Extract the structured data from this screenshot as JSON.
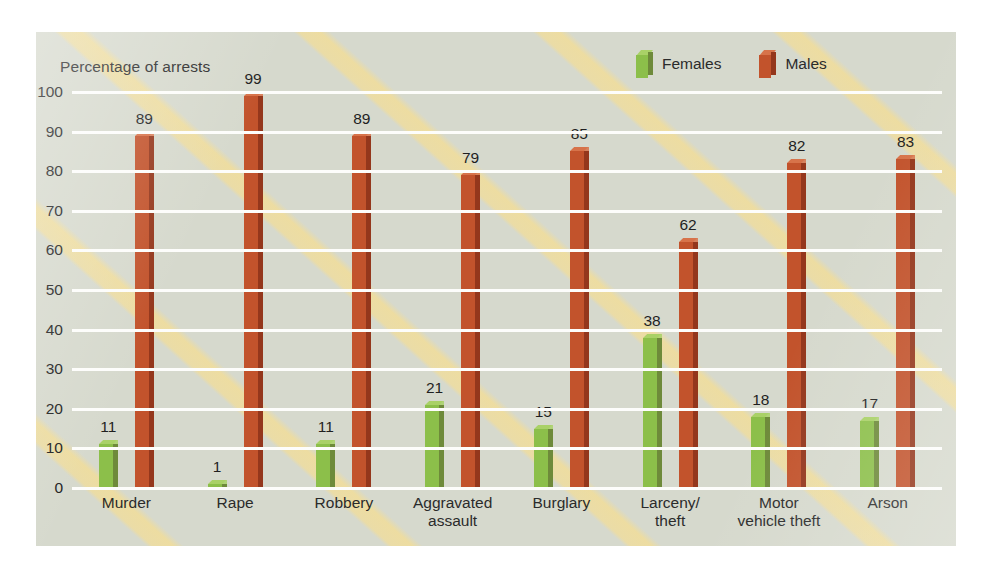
{
  "chart_data": {
    "type": "bar",
    "title": "Percentage of arrests",
    "xlabel": "",
    "ylabel": "Percentage of arrests",
    "ylim": [
      0,
      100
    ],
    "ytick_step": 10,
    "yticks": [
      "100",
      "90",
      "80",
      "70",
      "60",
      "50",
      "40",
      "30",
      "20",
      "10",
      "0"
    ],
    "grid": true,
    "grid_color": "#fdfdfb",
    "legend_position": "top-right",
    "categories": [
      "Murder",
      "Rape",
      "Robbery",
      "Aggravated assault",
      "Burglary",
      "Larceny/theft",
      "Motor vehicle theft",
      "Arson"
    ],
    "category_lines": [
      [
        "Murder"
      ],
      [
        "Rape"
      ],
      [
        "Robbery"
      ],
      [
        "Aggravated",
        "assault"
      ],
      [
        "Burglary"
      ],
      [
        "Larceny/",
        "theft"
      ],
      [
        "Motor",
        "vehicle theft"
      ],
      [
        "Arson"
      ]
    ],
    "series": [
      {
        "name": "Females",
        "color": "#8cbf4a",
        "side_color": "#6e8a3a",
        "top_color": "#a9d167",
        "values": [
          11,
          1,
          11,
          21,
          15,
          38,
          18,
          17
        ]
      },
      {
        "name": "Males",
        "color": "#c2532c",
        "side_color": "#94371c",
        "top_color": "#d7734a",
        "values": [
          89,
          99,
          89,
          79,
          85,
          62,
          82,
          83
        ]
      }
    ]
  },
  "legend": {
    "items": [
      {
        "label": "Females",
        "icon": "cube-green-icon"
      },
      {
        "label": "Males",
        "icon": "cube-orange-icon"
      }
    ]
  },
  "colors": {
    "panel_background": "#d6d9cd",
    "page_background": "#ffffff",
    "gridline": "#fdfdfb",
    "females": "#8cbf4a",
    "males": "#c2532c",
    "watermark": "#f7de8f",
    "text": "#2b2b2b"
  }
}
